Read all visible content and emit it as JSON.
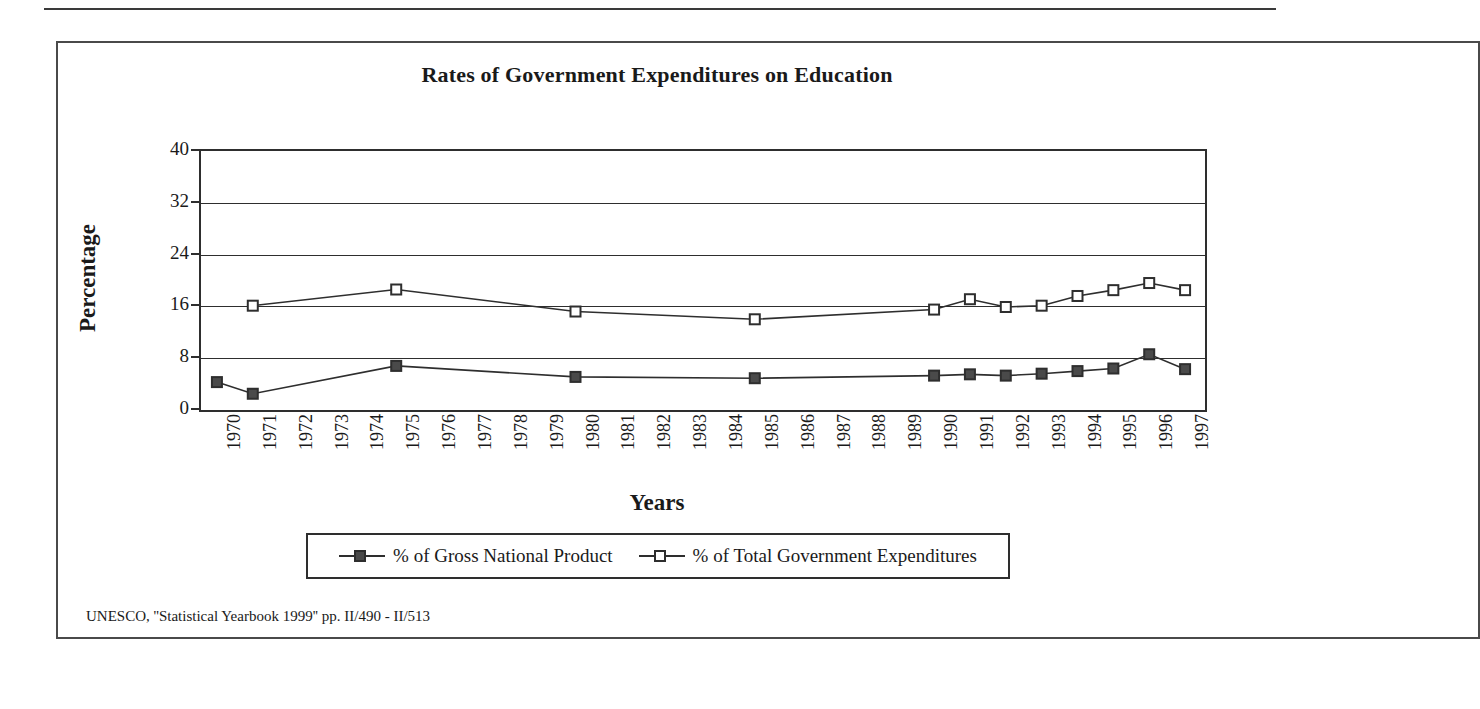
{
  "figure": {
    "title": "Rates of Government Expenditures on Education",
    "y_axis_title": "Percentage",
    "x_axis_title": "Years",
    "source_note": "UNESCO, ''Statistical Yearbook 1999'' pp. II/490 - II/513"
  },
  "legend": {
    "items": [
      {
        "label": "% of Gross National Product",
        "marker": "filled-square-marker",
        "color": "#4a4a4a"
      },
      {
        "label": "% of Total Government Expenditures",
        "marker": "open-square-marker",
        "color": "#ffffff"
      }
    ]
  },
  "chart_data": {
    "type": "line",
    "title": "Rates of Government Expenditures on Education",
    "xlabel": "Years",
    "ylabel": "Percentage",
    "ylim": [
      0,
      40
    ],
    "yticks": [
      0,
      8,
      16,
      24,
      32,
      40
    ],
    "grid": true,
    "legend_position": "bottom",
    "categories": [
      "1970",
      "1971",
      "1972",
      "1973",
      "1974",
      "1975",
      "1976",
      "1977",
      "1978",
      "1979",
      "1980",
      "1981",
      "1982",
      "1983",
      "1984",
      "1985",
      "1986",
      "1987",
      "1988",
      "1989",
      "1990",
      "1991",
      "1992",
      "1993",
      "1994",
      "1995",
      "1996",
      "1997"
    ],
    "series": [
      {
        "name": "% of Gross National Product",
        "marker": "filled-square",
        "color": "#4a4a4a",
        "values": [
          4.0,
          2.2,
          null,
          null,
          null,
          6.5,
          null,
          null,
          null,
          null,
          4.8,
          null,
          null,
          null,
          null,
          4.6,
          null,
          null,
          null,
          null,
          5.0,
          5.2,
          5.0,
          5.3,
          5.7,
          6.1,
          8.3,
          6.0
        ]
      },
      {
        "name": "% of Total Government Expenditures",
        "marker": "open-square",
        "color": "#ffffff",
        "values": [
          null,
          15.8,
          null,
          null,
          null,
          18.3,
          null,
          null,
          null,
          null,
          14.9,
          null,
          null,
          null,
          null,
          13.7,
          null,
          null,
          null,
          null,
          15.2,
          16.8,
          15.6,
          15.8,
          17.3,
          18.2,
          19.3,
          18.2
        ]
      }
    ]
  }
}
